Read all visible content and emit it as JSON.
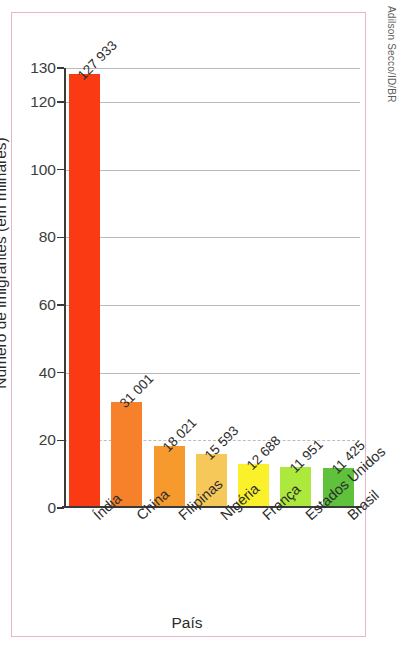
{
  "credit": "Adilson Secco/ID/BR",
  "title_visible_fragment": "dos imigrantes (2024)",
  "colors": {
    "frame_border": "#e7b6c8",
    "title": "#a8335c",
    "axis": "#3a3a3a",
    "gridline": "#bdbdbd",
    "text": "#2c2c2c"
  },
  "chart_data": {
    "type": "bar",
    "title": "dos imigrantes (2024)",
    "xlabel": "País",
    "ylabel": "Número de imigrantes (em milhares)",
    "categories": [
      "Índia",
      "China",
      "Filipinas",
      "Nigéria",
      "França",
      "Estados Unidos",
      "Brasil"
    ],
    "values": [
      127.933,
      31.001,
      18.021,
      15.593,
      12.688,
      11.951,
      11.425
    ],
    "value_labels": [
      "127 933",
      "31 001",
      "18 021",
      "15 593",
      "12 688",
      "11 951",
      "11 425"
    ],
    "bar_colors": [
      "#f93a12",
      "#f7812a",
      "#f79a2e",
      "#f6c759",
      "#faf12a",
      "#ade83c",
      "#5fc13c"
    ],
    "ylim": [
      0,
      130
    ],
    "yticks": [
      0,
      20,
      40,
      60,
      80,
      100,
      120,
      130
    ],
    "ytick_labels": [
      "0",
      "20",
      "40",
      "60",
      "80",
      "100",
      "120",
      "130"
    ],
    "grid": true,
    "legend": "none"
  }
}
